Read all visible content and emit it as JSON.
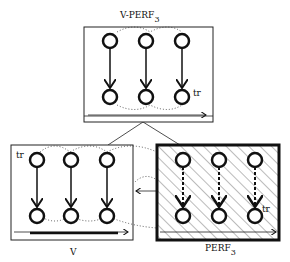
{
  "diagram": {
    "top": {
      "title": "V-PERF",
      "subscript": "3",
      "node_label": "tr"
    },
    "bottom_left": {
      "title": "V",
      "node_label": "tr"
    },
    "bottom_right": {
      "title": "PERF",
      "subscript": "3",
      "node_label": "tr"
    },
    "colors": {
      "ink": "#111111",
      "paper": "#ffffff"
    }
  }
}
